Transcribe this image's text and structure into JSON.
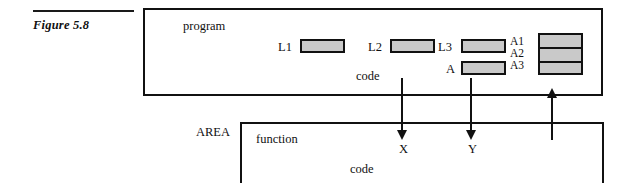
{
  "figure": {
    "label": "Figure 5.8"
  },
  "program_box": {
    "title": "program",
    "code_label": "code",
    "slots": [
      {
        "label": "L1",
        "fill": "#c9c9c9"
      },
      {
        "label": "L2",
        "fill": "#c9c9c9"
      },
      {
        "label": "L3",
        "fill": "#c9c9c9"
      },
      {
        "label": "A",
        "fill": "#c9c9c9"
      }
    ],
    "array_block": {
      "labels": [
        "A1",
        "A2",
        "A3"
      ],
      "rows": 3,
      "fill": "#c9c9c9"
    }
  },
  "area_box": {
    "outside_title": "AREA",
    "title": "function",
    "code_label": "code",
    "parameters": [
      "X",
      "Y"
    ]
  },
  "connectors": [
    {
      "name": "to-X",
      "direction": "down",
      "target": "X"
    },
    {
      "name": "to-Y",
      "direction": "down",
      "target": "Y"
    },
    {
      "name": "return-value",
      "direction": "up",
      "target": "A1"
    }
  ],
  "colors": {
    "ink": "#111111",
    "cell_fill": "#c9c9c9",
    "page": "#ffffff"
  }
}
